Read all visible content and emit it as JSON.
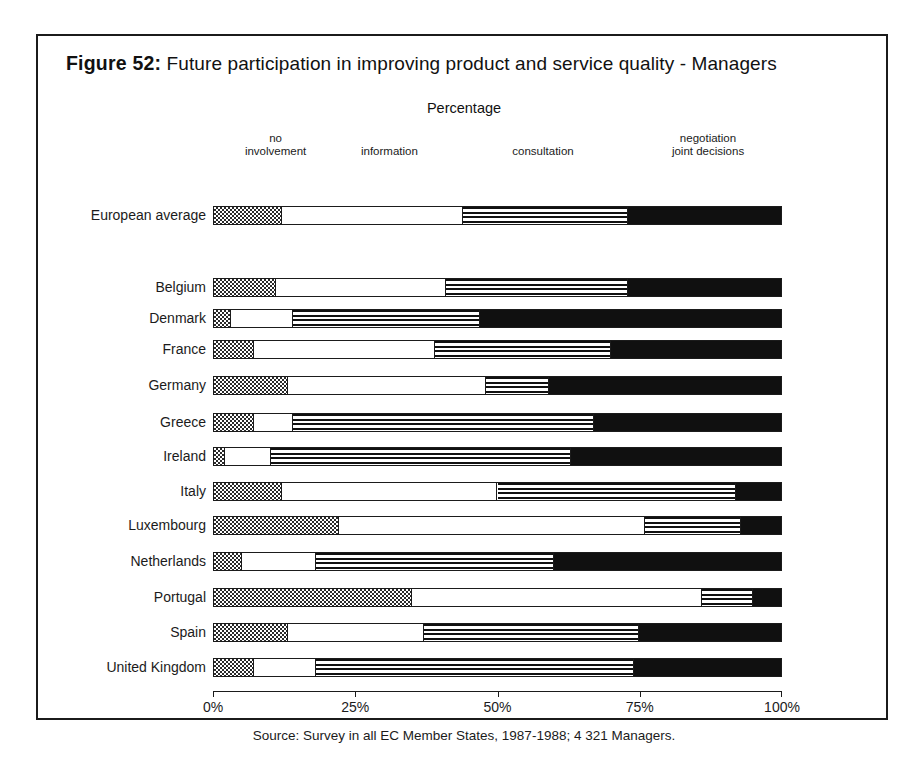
{
  "figure": {
    "number_label": "Figure 52:",
    "title": "Future participation in improving product and service quality - Managers",
    "axis_title": "Percentage",
    "source": "Source: Survey in all EC Member States, 1987-1988; 4 321 Managers."
  },
  "legend": [
    {
      "line1": "no",
      "line2": "involvement",
      "center_pct": 11
    },
    {
      "line1": "information",
      "line2": "",
      "center_pct": 31
    },
    {
      "line1": "consultation",
      "line2": "",
      "center_pct": 58
    },
    {
      "line1": "negotiation",
      "line2": "joint decisions",
      "center_pct": 87
    }
  ],
  "axis": {
    "ticks": [
      0,
      25,
      50,
      75,
      100
    ],
    "tick_labels": [
      "0%",
      "25%",
      "50%",
      "75%",
      "100%"
    ],
    "min": 0,
    "max": 100
  },
  "chart_data": {
    "type": "bar",
    "orientation": "horizontal",
    "stacked": true,
    "normalized": true,
    "title": "Future participation in improving product and service quality - Managers",
    "subtitle": "Figure 52",
    "xlabel": "Percentage",
    "ylabel": "",
    "xlim": [
      0,
      100
    ],
    "grid": false,
    "legend_position": "top",
    "categories": [
      "European average",
      "Belgium",
      "Denmark",
      "France",
      "Germany",
      "Greece",
      "Ireland",
      "Italy",
      "Luxembourg",
      "Netherlands",
      "Portugal",
      "Spain",
      "United Kingdom"
    ],
    "series": [
      {
        "name": "no involvement",
        "pattern": "checkerboard",
        "values": [
          12,
          11,
          3,
          7,
          13,
          7,
          2,
          12,
          22,
          5,
          35,
          13,
          7
        ]
      },
      {
        "name": "information",
        "pattern": "white",
        "values": [
          32,
          30,
          11,
          32,
          35,
          7,
          8,
          38,
          54,
          13,
          51,
          24,
          11
        ]
      },
      {
        "name": "consultation",
        "pattern": "horizontal-lines",
        "values": [
          29,
          32,
          33,
          31,
          11,
          53,
          53,
          42,
          17,
          42,
          9,
          38,
          56
        ]
      },
      {
        "name": "negotiation joint decisions",
        "pattern": "solid-black",
        "values": [
          27,
          27,
          53,
          30,
          41,
          33,
          37,
          8,
          7,
          40,
          5,
          25,
          26
        ]
      }
    ],
    "rows": [
      {
        "label": "European average",
        "boundaries": [
          12,
          44,
          73,
          100
        ],
        "group": "average"
      },
      {
        "label": "Belgium",
        "boundaries": [
          11,
          41,
          73,
          100
        ],
        "group": "country"
      },
      {
        "label": "Denmark",
        "boundaries": [
          3,
          14,
          47,
          100
        ],
        "group": "country"
      },
      {
        "label": "France",
        "boundaries": [
          7,
          39,
          70,
          100
        ],
        "group": "country"
      },
      {
        "label": "Germany",
        "boundaries": [
          13,
          48,
          59,
          100
        ],
        "group": "country"
      },
      {
        "label": "Greece",
        "boundaries": [
          7,
          14,
          67,
          100
        ],
        "group": "country"
      },
      {
        "label": "Ireland",
        "boundaries": [
          2,
          10,
          63,
          100
        ],
        "group": "country"
      },
      {
        "label": "Italy",
        "boundaries": [
          12,
          50,
          92,
          100
        ],
        "group": "country"
      },
      {
        "label": "Luxembourg",
        "boundaries": [
          22,
          76,
          93,
          100
        ],
        "group": "country"
      },
      {
        "label": "Netherlands",
        "boundaries": [
          5,
          18,
          60,
          100
        ],
        "group": "country"
      },
      {
        "label": "Portugal",
        "boundaries": [
          35,
          86,
          95,
          100
        ],
        "group": "country"
      },
      {
        "label": "Spain",
        "boundaries": [
          13,
          37,
          75,
          100
        ],
        "group": "country"
      },
      {
        "label": "United Kingdom",
        "boundaries": [
          7,
          18,
          74,
          100
        ],
        "group": "country"
      }
    ]
  }
}
